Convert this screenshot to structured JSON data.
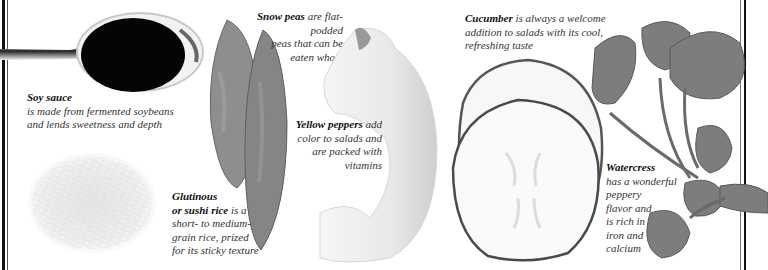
{
  "captions": {
    "soy_sauce": {
      "title": "Soy sauce",
      "line1": "is made from fermented soybeans",
      "line2": "and lends sweetness and depth"
    },
    "snow_peas": {
      "title": "Snow peas",
      "line1_rest": " are flat-podded",
      "line2": "peas that can be",
      "line3": "eaten whole"
    },
    "cucumber": {
      "title": "Cucumber",
      "line1_rest": " is always a welcome",
      "line2": "addition to salads with its cool,",
      "line3": "refreshing taste"
    },
    "yellow_peppers": {
      "title": "Yellow peppers",
      "line1_rest": " add",
      "line2": "color to salads and",
      "line3": "are packed with",
      "line4": "vitamins"
    },
    "glutinous_rice": {
      "title1": "Glutinous",
      "title2": "or sushi rice",
      "line2_rest": " is a",
      "line3": "short- to medium-",
      "line4": "grain rice, prized",
      "line5": "for its sticky texture"
    },
    "watercress": {
      "title": "Watercress",
      "line1": "has a wonderful",
      "line2": "peppery",
      "line3": "flavor and",
      "line4": "is rich in",
      "line5": "iron and",
      "line6": "calcium"
    }
  },
  "images": [
    {
      "name": "soy-sauce-spoon",
      "subject": "spoon of soy sauce"
    },
    {
      "name": "rice-pile",
      "subject": "glutinous rice grains"
    },
    {
      "name": "snow-peas",
      "subject": "two snow pea pods"
    },
    {
      "name": "yellow-pepper",
      "subject": "yellow pepper slice"
    },
    {
      "name": "cucumber-slices",
      "subject": "two cucumber slices"
    },
    {
      "name": "watercress",
      "subject": "watercress sprig"
    }
  ],
  "colors": {
    "border": "#111111",
    "text": "#333333",
    "soy": "#050505",
    "pea": "#8a8a8a",
    "leaf": "#7a7a7a"
  }
}
